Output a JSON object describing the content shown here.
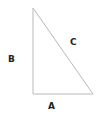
{
  "diagram": {
    "type": "right-triangle",
    "line_color": "#b8b8b8",
    "label_color": "#222222",
    "vertices": {
      "top": [
        33,
        8
      ],
      "bottom_left": [
        33,
        94
      ],
      "bottom_right": [
        93,
        94
      ]
    },
    "labels": {
      "vertical_side": "B",
      "hypotenuse": "C",
      "horizontal_side": "A"
    }
  }
}
